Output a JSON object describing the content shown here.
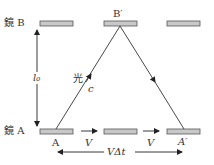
{
  "diagram": {
    "labels": {
      "mirror_b": "鏡 B",
      "mirror_a": "鏡 A",
      "b_prime": "B′",
      "a": "A",
      "a_prime": "A′",
      "light": "光",
      "c": "c",
      "l0": "l₀",
      "v1": "V",
      "v2": "V",
      "v_delta_t": "VΔt"
    },
    "colors": {
      "mirror_fill": "#c8c8c8",
      "mirror_stroke": "#555555",
      "line": "#333333"
    }
  }
}
